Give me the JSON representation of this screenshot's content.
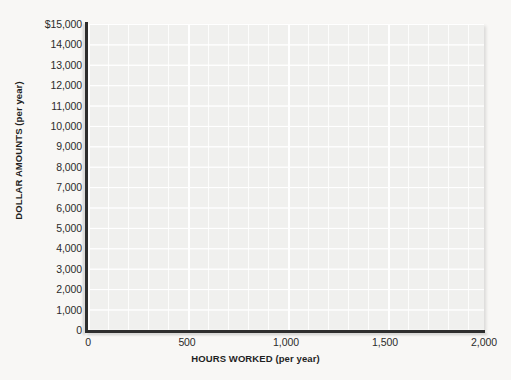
{
  "chart_data": {
    "type": "line",
    "title": "",
    "subtitle": "",
    "xlabel": "HOURS WORKED (per year)",
    "ylabel": "DOLLAR AMOUNTS (per year)",
    "xlim": [
      0,
      2000
    ],
    "ylim": [
      0,
      15000
    ],
    "x_ticks": [
      {
        "value": 0,
        "label": "0"
      },
      {
        "value": 500,
        "label": "500"
      },
      {
        "value": 1000,
        "label": "1,000"
      },
      {
        "value": 1500,
        "label": "1,500"
      },
      {
        "value": 2000,
        "label": "2,000"
      }
    ],
    "y_ticks": [
      {
        "value": 15000,
        "label": "$15,000"
      },
      {
        "value": 14000,
        "label": "14,000"
      },
      {
        "value": 13000,
        "label": "13,000"
      },
      {
        "value": 12000,
        "label": "12,000"
      },
      {
        "value": 11000,
        "label": "11,000"
      },
      {
        "value": 10000,
        "label": "10,000"
      },
      {
        "value": 9000,
        "label": "9,000"
      },
      {
        "value": 8000,
        "label": "8,000"
      },
      {
        "value": 7000,
        "label": "7,000"
      },
      {
        "value": 6000,
        "label": "6,000"
      },
      {
        "value": 5000,
        "label": "5,000"
      },
      {
        "value": 4000,
        "label": "4,000"
      },
      {
        "value": 3000,
        "label": "3,000"
      },
      {
        "value": 2000,
        "label": "2,000"
      },
      {
        "value": 1000,
        "label": "1,000"
      },
      {
        "value": 0,
        "label": "0"
      }
    ],
    "series": [],
    "legend": [],
    "annotations": [],
    "grid": {
      "major_x_step": 500,
      "major_y_step": 1000,
      "minor_x_step": 100,
      "minor_y_step": 1000,
      "visible": true
    },
    "colors": {
      "plot_background": "#f0f0ee",
      "page_background": "#f8f7f5",
      "gridline": "#ffffff",
      "axis": "#2e2e2e",
      "text": "#2b2b2b"
    }
  }
}
